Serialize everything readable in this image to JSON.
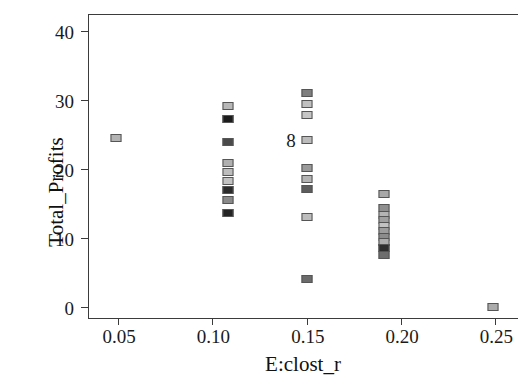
{
  "chart_data": {
    "type": "scatter",
    "title": "",
    "xlabel": "E:clost_r",
    "ylabel": "Total_Profits",
    "xlim": [
      0.034,
      0.262
    ],
    "ylim": [
      -1.6,
      42.5
    ],
    "xticks": [
      0.05,
      0.1,
      0.15,
      0.2,
      0.25
    ],
    "xtick_labels": [
      "0.05",
      "0.10",
      "0.15",
      "0.20",
      "0.25"
    ],
    "yticks": [
      0,
      10,
      20,
      30,
      40
    ],
    "ytick_labels": [
      "0",
      "10",
      "20",
      "30",
      "40"
    ],
    "grid": false,
    "legend": null,
    "marker_shape": "square",
    "annotations": [
      {
        "text": "8",
        "x": 0.15,
        "y": 24.2
      }
    ],
    "points": [
      {
        "x": 0.049,
        "y": 24.5,
        "color": "#b3b3b3"
      },
      {
        "x": 0.108,
        "y": 29.1,
        "color": "#b8b8b8"
      },
      {
        "x": 0.108,
        "y": 27.2,
        "color": "#1c1c1c"
      },
      {
        "x": 0.108,
        "y": 23.9,
        "color": "#4a4a4a"
      },
      {
        "x": 0.108,
        "y": 20.9,
        "color": "#b0b0b0"
      },
      {
        "x": 0.108,
        "y": 19.6,
        "color": "#bdbdbd"
      },
      {
        "x": 0.108,
        "y": 18.3,
        "color": "#c2c2c2"
      },
      {
        "x": 0.108,
        "y": 17.0,
        "color": "#2b2b2b"
      },
      {
        "x": 0.108,
        "y": 15.5,
        "color": "#8a8a8a"
      },
      {
        "x": 0.108,
        "y": 13.6,
        "color": "#242424"
      },
      {
        "x": 0.15,
        "y": 31.0,
        "color": "#7f7f7f"
      },
      {
        "x": 0.15,
        "y": 29.5,
        "color": "#c0c0c0"
      },
      {
        "x": 0.15,
        "y": 27.9,
        "color": "#c6c6c6"
      },
      {
        "x": 0.15,
        "y": 24.2,
        "color": "#bcbcbc"
      },
      {
        "x": 0.15,
        "y": 20.2,
        "color": "#9a9a9a"
      },
      {
        "x": 0.15,
        "y": 18.6,
        "color": "#b5b5b5"
      },
      {
        "x": 0.15,
        "y": 17.1,
        "color": "#5d5d5d"
      },
      {
        "x": 0.15,
        "y": 13.0,
        "color": "#bdbdbd"
      },
      {
        "x": 0.15,
        "y": 4.0,
        "color": "#6b6b6b"
      },
      {
        "x": 0.191,
        "y": 16.4,
        "color": "#a8a8a8"
      },
      {
        "x": 0.191,
        "y": 14.3,
        "color": "#8f8f8f"
      },
      {
        "x": 0.191,
        "y": 13.4,
        "color": "#b4b4b4"
      },
      {
        "x": 0.191,
        "y": 12.6,
        "color": "#a0a0a0"
      },
      {
        "x": 0.191,
        "y": 11.8,
        "color": "#c2c2c2"
      },
      {
        "x": 0.191,
        "y": 11.0,
        "color": "#9d9d9d"
      },
      {
        "x": 0.191,
        "y": 10.2,
        "color": "#8c8c8c"
      },
      {
        "x": 0.191,
        "y": 9.4,
        "color": "#acacac"
      },
      {
        "x": 0.191,
        "y": 8.6,
        "color": "#2e2e2e"
      },
      {
        "x": 0.191,
        "y": 7.6,
        "color": "#6e6e6e"
      },
      {
        "x": 0.249,
        "y": 0.0,
        "color": "#ababab"
      }
    ]
  }
}
